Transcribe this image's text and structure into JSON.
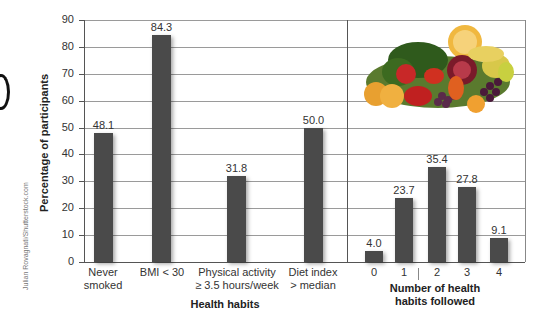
{
  "chart_data": [
    {
      "type": "bar",
      "title": "",
      "xlabel": "Health habits",
      "ylabel": "Percentage of participants",
      "ylim": [
        0,
        90
      ],
      "yticks": [
        0,
        10,
        20,
        30,
        40,
        50,
        60,
        70,
        80,
        90
      ],
      "grid": true,
      "categories": [
        "Never smoked",
        "BMI < 30",
        "Physical activity ≥ 3.5 hours/week",
        "Diet index > median"
      ],
      "values": [
        48.1,
        84.3,
        31.8,
        50.0
      ],
      "data_labels": [
        "48.1",
        "84.3",
        "31.8",
        "50.0"
      ]
    },
    {
      "type": "bar",
      "title": "",
      "xlabel": "Number of health habits followed",
      "ylabel": "Percentage of participants",
      "ylim": [
        0,
        90
      ],
      "grid": true,
      "categories": [
        "0",
        "1",
        "2",
        "3",
        "4"
      ],
      "values": [
        4.0,
        23.7,
        35.4,
        27.8,
        9.1
      ],
      "data_labels": [
        "4.0",
        "23.7",
        "35.4",
        "27.8",
        "9.1"
      ]
    }
  ],
  "labels": {
    "ylabel": "Percentage of participants",
    "left_xlabel": "Health habits",
    "right_xlabel_line1": "Number of health",
    "right_xlabel_line2": "habits followed",
    "credit": "Julian Rovagnati/Shutterstock.com",
    "yticks": [
      "0",
      "10",
      "20",
      "30",
      "40",
      "50",
      "60",
      "70",
      "80",
      "90"
    ],
    "left_cats": [
      {
        "l1": "Never",
        "l2": "smoked"
      },
      {
        "l1": "BMI < 30",
        "l2": ""
      },
      {
        "l1": "Physical activity",
        "l2": "≥ 3.5 hours/week"
      },
      {
        "l1": "Diet index",
        "l2": "> median"
      }
    ],
    "left_values": [
      "48.1",
      "84.3",
      "31.8",
      "50.0"
    ],
    "right_cats": [
      "0",
      "1",
      "2",
      "3",
      "4"
    ],
    "right_values": [
      "4.0",
      "23.7",
      "35.4",
      "27.8",
      "9.1"
    ]
  },
  "colors": {
    "bar": "#4a4a4a",
    "grid": "#9a9a9a",
    "axis": "#555555"
  },
  "image": {
    "description": "fruits-and-vegetables-photo"
  }
}
